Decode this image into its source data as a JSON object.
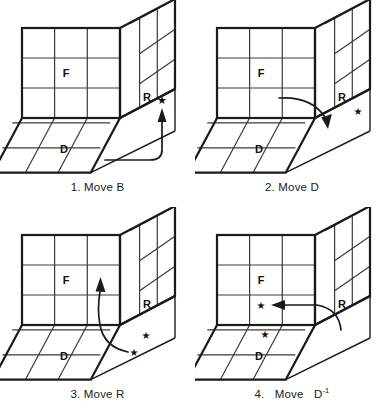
{
  "figure": {
    "panel_count": 4,
    "face_labels": {
      "front": "F",
      "right": "R",
      "down": "D"
    },
    "star_glyph": "★",
    "colors": {
      "ink": "#111111",
      "grid_line": "#3a3a3a",
      "outline": "#1a1a1a",
      "background": "#ffffff",
      "arrow": "#1a1a1a"
    },
    "panels": [
      {
        "index": "1",
        "caption": "1. Move B",
        "caption_number": "1.",
        "move_word": "Move",
        "move_notation": "B",
        "move_exponent": "",
        "labels": {
          "front": "F",
          "right": "R",
          "down": "D"
        },
        "stars": 1,
        "arrow_description": "curved arrow sweeping from bottom edge up the far right column, pointing up"
      },
      {
        "index": "2",
        "caption": "2. Move D",
        "caption_number": "2.",
        "move_word": "Move",
        "move_notation": "D",
        "move_exponent": "",
        "labels": {
          "front": "F",
          "right": "R",
          "down": "D"
        },
        "stars": 1,
        "arrow_description": "curved arrow sweeping from front face rightward and down onto the right face, pointing down"
      },
      {
        "index": "3",
        "caption": "3. Move R",
        "caption_number": "3.",
        "move_word": "Move",
        "move_notation": "R",
        "move_exponent": "",
        "labels": {
          "front": "F",
          "right": "R",
          "down": "D"
        },
        "stars": 2,
        "arrow_description": "curved arrow sweeping from the down face up the right column of the front face, pointing up"
      },
      {
        "index": "4",
        "caption": "4. Move D⁻¹",
        "caption_number": "4.",
        "move_word": "Move",
        "move_notation": "D",
        "move_exponent": "-1",
        "labels": {
          "front": "F",
          "right": "R",
          "down": "D"
        },
        "stars": 2,
        "arrow_description": "curved arrow sweeping from the right face leftward across the front face, pointing left"
      }
    ]
  }
}
